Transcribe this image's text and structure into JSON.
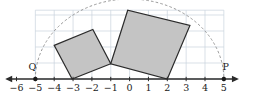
{
  "figure": {
    "title": "",
    "background_color": "#ffffff",
    "width": 258,
    "height": 104
  },
  "chart_data": {
    "type": "scatter",
    "title": "",
    "xlabel": "",
    "ylabel": "",
    "grid": true,
    "legend_position": "none",
    "xlim": [
      -6.6,
      5.8
    ],
    "ylim": [
      -0.9,
      4.6
    ],
    "axis": {
      "name": "number-line",
      "y": 0,
      "arrow_left": true,
      "arrow_right": true,
      "x_start": -6.6,
      "x_end": 5.8,
      "color": "#2b2b2b",
      "tick_values": [
        -6,
        -5,
        -4,
        -3,
        -2,
        -1,
        0,
        1,
        2,
        3,
        4,
        5
      ],
      "tick_labels": [
        "−6",
        "−5",
        "−4",
        "−3",
        "−2",
        "−1",
        "0",
        "1",
        "2",
        "3",
        "4",
        "5"
      ]
    },
    "grid_spec": {
      "color": "#c9d3dd",
      "x_lines": [
        -5,
        -4,
        -3,
        -2,
        -1,
        0,
        1,
        2,
        3,
        4,
        5
      ],
      "y_lines": [
        0,
        1,
        2,
        3,
        4
      ],
      "x_min": -5,
      "x_max": 5,
      "y_min": 0,
      "y_max": 4.3
    },
    "points": [
      {
        "name": "Q",
        "label": "Q",
        "x": -5,
        "y": 0,
        "marker": "filled-circle",
        "color": "#1a1a1a",
        "label_dx": -0.15,
        "label_dy": 0.55
      },
      {
        "name": "P",
        "label": "P",
        "x": 5,
        "y": 0,
        "marker": "filled-circle",
        "color": "#1a1a1a",
        "label_dx": 0.1,
        "label_dy": 0.55
      }
    ],
    "arc": {
      "name": "semicircle-arc",
      "style": "dashed",
      "color": "#8d8d8d",
      "center_x": 0,
      "center_y": 0,
      "radius": 5,
      "start_angle_deg": 180,
      "end_angle_deg": 0
    },
    "polygons": [
      {
        "name": "small-square",
        "fill": "#c4c4c4",
        "stroke": "#2b2b2b",
        "stroke_width": 1.2,
        "vertices": [
          [
            -3.05,
            0.0
          ],
          [
            -4.0,
            2.1
          ],
          [
            -1.95,
            3.1
          ],
          [
            -1.0,
            0.95
          ]
        ]
      },
      {
        "name": "large-square",
        "fill": "#c4c4c4",
        "stroke": "#2b2b2b",
        "stroke_width": 1.2,
        "vertices": [
          [
            -1.0,
            0.95
          ],
          [
            -0.1,
            4.3
          ],
          [
            3.2,
            3.35
          ],
          [
            2.0,
            0.0
          ]
        ]
      }
    ]
  }
}
